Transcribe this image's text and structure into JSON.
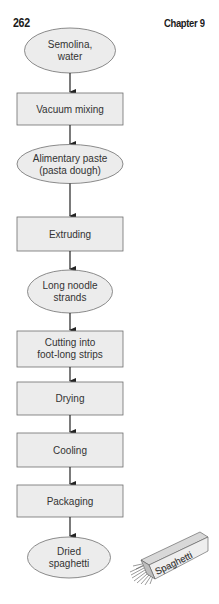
{
  "header": {
    "page_number": "262",
    "chapter": "Chapter 9"
  },
  "flowchart": {
    "colors": {
      "fill": "#ececec",
      "stroke": "#6e6e6e",
      "arrow": "#222222",
      "text": "#333333"
    },
    "nodes": [
      {
        "shape": "ellipse",
        "line1": "Semolina,",
        "line2": "water"
      },
      {
        "shape": "box",
        "line1": "Vacuum mixing",
        "line2": ""
      },
      {
        "shape": "ellipse",
        "line1": "Alimentary paste",
        "line2": "(pasta dough)"
      },
      {
        "shape": "box",
        "line1": "Extruding",
        "line2": ""
      },
      {
        "shape": "ellipse",
        "line1": "Long noodle",
        "line2": "strands"
      },
      {
        "shape": "box",
        "line1": "Cutting into",
        "line2": "foot-long strips"
      },
      {
        "shape": "box",
        "line1": "Drying",
        "line2": ""
      },
      {
        "shape": "box",
        "line1": "Cooling",
        "line2": ""
      },
      {
        "shape": "box",
        "line1": "Packaging",
        "line2": ""
      },
      {
        "shape": "ellipse",
        "line1": "Dried",
        "line2": "spaghetti"
      }
    ]
  },
  "illustration": {
    "label": "Spaghetti",
    "subject": "spaghetti-package"
  }
}
